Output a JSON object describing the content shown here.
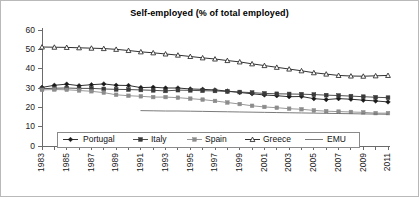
{
  "chart_data": {
    "type": "line",
    "title": "Self-employed (% of total employed)",
    "xlabel": "",
    "ylabel": "",
    "ylim": [
      0,
      60
    ],
    "yticks": [
      0,
      10,
      20,
      30,
      40,
      50,
      60
    ],
    "xlim": [
      1983,
      2011
    ],
    "x": [
      1983,
      1984,
      1985,
      1986,
      1987,
      1988,
      1989,
      1990,
      1991,
      1992,
      1993,
      1994,
      1995,
      1996,
      1997,
      1998,
      1999,
      2000,
      2001,
      2002,
      2003,
      2004,
      2005,
      2006,
      2007,
      2008,
      2009,
      2010,
      2011
    ],
    "xticks": [
      1983,
      1985,
      1987,
      1989,
      1991,
      1993,
      1995,
      1997,
      1999,
      2001,
      2003,
      2005,
      2007,
      2009,
      2011
    ],
    "xtick_labels": [
      "1983",
      "1985",
      "1987",
      "1989",
      "1991",
      "1993",
      "1995",
      "1997",
      "1999",
      "2001",
      "2003",
      "2005",
      "2007",
      "2009",
      "2011"
    ],
    "grid": false,
    "legend_position": "bottom-inside",
    "series": [
      {
        "name": "Portugal",
        "marker": "diamond",
        "color": "#1a1a1a",
        "values": [
          30.3,
          31.4,
          32.0,
          31.2,
          31.7,
          32.1,
          31.4,
          31.3,
          30.2,
          30.4,
          30.0,
          30.0,
          29.5,
          29.3,
          29.0,
          28.4,
          27.7,
          27.0,
          26.4,
          26.0,
          25.5,
          25.6,
          24.5,
          24.0,
          24.5,
          24.2,
          23.7,
          23.3,
          22.8
        ]
      },
      {
        "name": "Italy",
        "marker": "square",
        "color": "#3a3a3a",
        "values": [
          29.6,
          29.9,
          30.0,
          29.8,
          29.8,
          29.5,
          29.3,
          29.2,
          29.0,
          28.8,
          28.5,
          28.9,
          28.8,
          28.6,
          28.5,
          28.2,
          27.9,
          27.6,
          27.2,
          27.0,
          26.9,
          26.8,
          26.6,
          26.3,
          26.1,
          25.8,
          25.5,
          25.2,
          25.0
        ]
      },
      {
        "name": "Spain",
        "marker": "small-square",
        "color": "#8c8c8c",
        "values": [
          29.0,
          29.2,
          29.1,
          28.7,
          28.3,
          27.6,
          26.5,
          26.0,
          25.7,
          25.3,
          25.3,
          25.0,
          24.5,
          24.0,
          23.3,
          22.5,
          21.7,
          20.8,
          20.2,
          19.8,
          19.3,
          19.0,
          18.4,
          18.0,
          17.8,
          17.6,
          17.4,
          17.0,
          17.0
        ]
      },
      {
        "name": "Greece",
        "marker": "triangle",
        "color": "#1a1a1a",
        "values": [
          51.2,
          51.1,
          51.0,
          50.8,
          50.6,
          50.4,
          50.0,
          49.4,
          48.7,
          48.2,
          47.6,
          47.0,
          46.3,
          45.6,
          45.0,
          44.2,
          43.5,
          42.5,
          41.6,
          40.7,
          39.8,
          38.9,
          37.9,
          37.2,
          36.5,
          36.2,
          36.1,
          36.3,
          36.5
        ]
      },
      {
        "name": "EMU",
        "marker": "none",
        "color": "#6b6b6b",
        "start_year": 1991,
        "values": [
          null,
          null,
          null,
          null,
          null,
          null,
          null,
          null,
          18.3,
          18.2,
          18.1,
          18.1,
          18.0,
          17.9,
          17.8,
          17.7,
          17.6,
          17.5,
          17.4,
          17.3,
          17.2,
          17.1,
          17.0,
          16.9,
          16.8,
          16.7,
          16.6,
          16.5,
          16.4
        ]
      }
    ]
  },
  "legend": {
    "items": [
      {
        "label": "Portugal"
      },
      {
        "label": "Italy"
      },
      {
        "label": "Spain"
      },
      {
        "label": "Greece"
      },
      {
        "label": "EMU"
      }
    ]
  }
}
